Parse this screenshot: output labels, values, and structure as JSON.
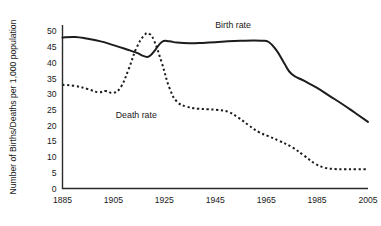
{
  "chart_data": {
    "type": "line",
    "title": "",
    "xlabel": "",
    "ylabel": "Number of Births/Deaths per 1,000 population",
    "xlim": [
      1885,
      2005
    ],
    "ylim": [
      0,
      52
    ],
    "grid": false,
    "legend_position": "inline-labels",
    "x_ticks": [
      "1885",
      "1905",
      "1925",
      "1945",
      "1965",
      "1985",
      "2005"
    ],
    "x_tick_values": [
      1885,
      1905,
      1925,
      1945,
      1965,
      1985,
      2005
    ],
    "y_ticks": [
      "0",
      "5",
      "10",
      "15",
      "20",
      "25",
      "30",
      "35",
      "40",
      "45",
      "50"
    ],
    "y_tick_values": [
      0,
      5,
      10,
      15,
      20,
      25,
      30,
      35,
      40,
      45,
      50
    ],
    "series": [
      {
        "name": "Birth rate",
        "style": "solid",
        "color": "#1c1c1c",
        "label_x": 1952,
        "label_y": 51,
        "points": [
          [
            1885,
            48.0
          ],
          [
            1890,
            48.2
          ],
          [
            1895,
            47.6
          ],
          [
            1900,
            46.8
          ],
          [
            1905,
            45.6
          ],
          [
            1910,
            44.3
          ],
          [
            1914,
            43.2
          ],
          [
            1917,
            42.1
          ],
          [
            1919,
            42.0
          ],
          [
            1921,
            43.6
          ],
          [
            1924,
            46.6
          ],
          [
            1927,
            46.8
          ],
          [
            1930,
            46.4
          ],
          [
            1935,
            46.2
          ],
          [
            1940,
            46.3
          ],
          [
            1945,
            46.5
          ],
          [
            1950,
            46.8
          ],
          [
            1955,
            47.0
          ],
          [
            1960,
            47.1
          ],
          [
            1963,
            47.0
          ],
          [
            1966,
            46.6
          ],
          [
            1969,
            44.0
          ],
          [
            1972,
            40.0
          ],
          [
            1975,
            36.4
          ],
          [
            1980,
            34.2
          ],
          [
            1985,
            32.0
          ],
          [
            1990,
            29.4
          ],
          [
            1995,
            26.8
          ],
          [
            2000,
            24.0
          ],
          [
            2005,
            21.2
          ]
        ]
      },
      {
        "name": "Death rate",
        "style": "dotted",
        "color": "#1c1c1c",
        "label_x": 1914,
        "label_y": 22.5,
        "points": [
          [
            1885,
            33.0
          ],
          [
            1890,
            32.6
          ],
          [
            1895,
            31.6
          ],
          [
            1899,
            30.6
          ],
          [
            1902,
            31.0
          ],
          [
            1905,
            30.4
          ],
          [
            1908,
            32.4
          ],
          [
            1911,
            38.0
          ],
          [
            1914,
            44.6
          ],
          [
            1917,
            48.6
          ],
          [
            1919,
            49.2
          ],
          [
            1921,
            47.0
          ],
          [
            1924,
            40.0
          ],
          [
            1927,
            32.0
          ],
          [
            1930,
            27.6
          ],
          [
            1934,
            26.0
          ],
          [
            1938,
            25.4
          ],
          [
            1942,
            25.2
          ],
          [
            1946,
            25.0
          ],
          [
            1950,
            24.4
          ],
          [
            1954,
            22.6
          ],
          [
            1958,
            20.2
          ],
          [
            1962,
            18.0
          ],
          [
            1966,
            16.6
          ],
          [
            1970,
            15.2
          ],
          [
            1975,
            13.2
          ],
          [
            1980,
            10.4
          ],
          [
            1984,
            8.0
          ],
          [
            1988,
            6.6
          ],
          [
            1992,
            6.2
          ],
          [
            1996,
            6.1
          ],
          [
            2000,
            6.1
          ],
          [
            2005,
            6.1
          ]
        ]
      }
    ]
  }
}
